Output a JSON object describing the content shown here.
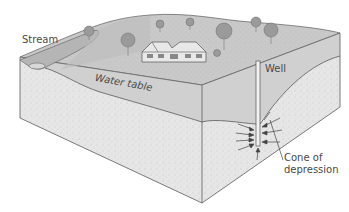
{
  "diagram": {
    "labels": {
      "stream": "Stream",
      "water_table": "Water table",
      "well": "Well",
      "cone_line1": "Cone of",
      "cone_line2": "depression"
    },
    "colors": {
      "surface": "#c9c9c9",
      "unsaturated": "#d4d4d4",
      "saturated": "#e6e6e6",
      "outline": "#6b6b6b",
      "trees": "#9a9a9a",
      "text": "#4a4a4a"
    },
    "elements": [
      "land-surface",
      "stream",
      "house",
      "trees",
      "water-table",
      "well",
      "flow-arrows",
      "cone-of-depression"
    ]
  }
}
